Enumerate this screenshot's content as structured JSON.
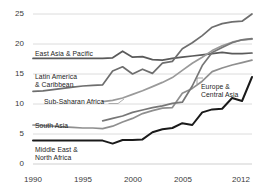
{
  "chart_data": {
    "type": "line",
    "title": "",
    "subtitle": "",
    "xlabel": "",
    "ylabel": "",
    "xlim": [
      1990,
      2012
    ],
    "ylim": [
      0,
      25
    ],
    "grid": true,
    "grid_axis": "y",
    "legend_position": "inline-labels",
    "yticks": [
      0,
      5,
      10,
      15,
      20,
      25
    ],
    "ytick_labels": [
      "0",
      "5",
      "10",
      "15",
      "20",
      "25"
    ],
    "xticks": [
      1990,
      1995,
      2000,
      2005,
      2012
    ],
    "xtick_labels": [
      "1990",
      "1995",
      "2000",
      "2005",
      "2012"
    ],
    "series": [
      {
        "name": "East Asia & Pacific",
        "color": "#5a5a5a",
        "label_position": "left-inline",
        "x": [
          1990,
          1991,
          1992,
          1993,
          1994,
          1995,
          1996,
          1997,
          1998,
          1999,
          2000,
          2001,
          2002,
          2003,
          2004,
          2005,
          2006,
          2007,
          2008,
          2009,
          2010,
          2011,
          2012
        ],
        "values": [
          17.6,
          17.6,
          17.6,
          17.6,
          17.6,
          17.6,
          17.6,
          17.6,
          17.7,
          18.8,
          17.8,
          17.9,
          17.4,
          17.3,
          17.6,
          17.8,
          18.0,
          18.2,
          18.4,
          18.6,
          18.4,
          18.4,
          18.5
        ]
      },
      {
        "name": "Latin America & Caribbean",
        "color": "#6e6e6e",
        "label_position": "left-inline",
        "x": [
          1990,
          1991,
          1992,
          1993,
          1994,
          1995,
          1996,
          1997,
          1998,
          1999,
          2000,
          2001,
          2002,
          2003,
          2004,
          2005,
          2006,
          2007,
          2008,
          2009,
          2010,
          2011,
          2012
        ],
        "values": [
          12.1,
          12.2,
          12.4,
          12.6,
          12.8,
          13.0,
          13.1,
          13.2,
          15.5,
          16.2,
          15.0,
          15.8,
          15.1,
          16.8,
          17.1,
          19.2,
          20.2,
          21.4,
          22.8,
          23.4,
          23.7,
          23.8,
          25.0
        ]
      },
      {
        "name": "Sub-Saharan Africa",
        "color": "#9a9a9a",
        "label_position": "left-leader",
        "x": [
          1997,
          1998,
          1999,
          2000,
          2001,
          2002,
          2003,
          2004,
          2005,
          2006,
          2007,
          2008,
          2009,
          2010,
          2011,
          2012
        ],
        "values": [
          10.4,
          10.6,
          11.0,
          11.6,
          12.2,
          12.9,
          13.6,
          14.4,
          15.6,
          16.8,
          17.8,
          18.9,
          19.7,
          20.3,
          20.7,
          20.8
        ]
      },
      {
        "name": "South Asia",
        "color": "#8f8f8f",
        "label_position": "left-inline",
        "x": [
          1990,
          1991,
          1992,
          1993,
          1994,
          1995,
          1996,
          1997,
          1998,
          1999,
          2000,
          2001,
          2002,
          2003,
          2004,
          2005,
          2006,
          2007,
          2008,
          2009,
          2010,
          2011,
          2012
        ],
        "values": [
          6.5,
          6.4,
          6.3,
          6.2,
          6.1,
          6.0,
          6.0,
          5.9,
          6.3,
          7.0,
          7.6,
          8.4,
          8.9,
          9.3,
          9.4,
          11.8,
          12.6,
          13.8,
          15.4,
          16.0,
          16.5,
          16.9,
          17.3
        ]
      },
      {
        "name": "Europe & Central Asia",
        "color": "#777777",
        "label_position": "right-leader",
        "x": [
          1997,
          1998,
          1999,
          2000,
          2001,
          2002,
          2003,
          2004,
          2005,
          2006,
          2007,
          2008,
          2009,
          2010,
          2011,
          2012
        ],
        "values": [
          7.2,
          7.6,
          8.0,
          8.6,
          9.0,
          9.4,
          9.7,
          10.1,
          10.3,
          13.0,
          16.4,
          18.6,
          19.4,
          20.2,
          20.7,
          20.9
        ]
      },
      {
        "name": "Middle East & North Africa",
        "color": "#1a1a1a",
        "label_position": "left-inline",
        "x": [
          1990,
          1991,
          1992,
          1993,
          1994,
          1995,
          1996,
          1997,
          1998,
          1999,
          2000,
          2001,
          2002,
          2003,
          2004,
          2005,
          2006,
          2007,
          2008,
          2009,
          2010,
          2011,
          2012
        ],
        "values": [
          3.9,
          3.9,
          3.9,
          3.9,
          3.9,
          3.9,
          3.9,
          3.9,
          3.4,
          4.0,
          4.0,
          4.1,
          5.3,
          5.8,
          6.0,
          6.8,
          6.5,
          8.6,
          9.1,
          9.2,
          11.0,
          10.5,
          14.5
        ]
      }
    ]
  },
  "axis": {
    "y_labels": [
      "25",
      "20",
      "15",
      "10",
      "5",
      "0"
    ],
    "x_labels": [
      "1990",
      "1995",
      "2000",
      "2005",
      "2012"
    ]
  },
  "labels": {
    "east_asia_pacific": "East Asia & Pacific",
    "latin_america_caribbean": "Latin America\n& Caribbean",
    "sub_saharan_africa": "Sub-Saharan Africa",
    "south_asia": "South Asia",
    "europe_central_asia": "Europe &\nCentral Asia",
    "middle_east_north_africa": "Middle East &\nNorth Africa"
  },
  "colors": {
    "background": "#ffffff",
    "gridline": "#d8d8d8",
    "axis_text": "#3a3a3a",
    "label_text": "#1d1d1d"
  }
}
